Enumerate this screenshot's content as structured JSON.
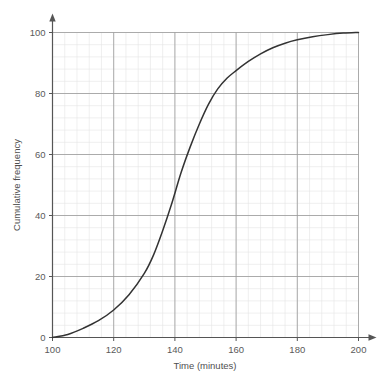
{
  "chart_data": {
    "type": "line",
    "title": "",
    "subtitle": "",
    "xlabel": "Time (minutes)",
    "ylabel": "Cumulative frequency",
    "xlim": [
      100,
      200
    ],
    "ylim": [
      0,
      100
    ],
    "xticks": [
      100,
      120,
      140,
      160,
      180,
      200
    ],
    "yticks": [
      0,
      20,
      40,
      60,
      80,
      100
    ],
    "xtick_labels": [
      "100",
      "120",
      "140",
      "160",
      "180",
      "200"
    ],
    "ytick_labels": [
      "0",
      "20",
      "40",
      "60",
      "80",
      "100"
    ],
    "grid": true,
    "major_grid_color": "#999999",
    "minor_grid_color": "#e4e4e4",
    "minor_ticks_per_major": 5,
    "axis_color": "#555555",
    "axis_arrows": true,
    "legend": "none",
    "series": [
      {
        "name": "Cumulative frequency",
        "color": "#333333",
        "line_width": 1.5,
        "x": [
          100,
          105,
          110,
          115,
          120,
          125,
          130,
          133,
          136,
          139,
          142,
          145,
          148,
          151,
          154,
          157,
          160,
          164,
          168,
          172,
          176,
          180,
          185,
          190,
          195,
          200
        ],
        "y": [
          0,
          1,
          3,
          5.5,
          9,
          14,
          21,
          27,
          35,
          44,
          54,
          62.5,
          70,
          76.5,
          81.5,
          85,
          87.5,
          90.5,
          93,
          95,
          96.5,
          97.6,
          98.6,
          99.3,
          99.8,
          100
        ]
      }
    ],
    "annotations": []
  }
}
